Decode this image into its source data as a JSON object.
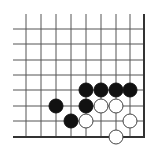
{
  "board": {
    "type": "go-diagram",
    "description": "Lower-right corner of a Go board",
    "colors": {
      "background": "#ffffff",
      "line": "#555555",
      "edge": "#333333",
      "black_stone": "#111111",
      "white_stone": "#ffffff",
      "white_outline": "#444444"
    },
    "grid": {
      "x_lines": [
        26,
        41,
        56,
        71,
        86,
        101,
        116,
        130
      ],
      "y_lines": [
        29,
        44,
        60,
        75,
        90,
        106,
        121
      ],
      "right_edge_x": 144,
      "bottom_edge_y": 137,
      "line_left_start": 13,
      "line_top_start": 14
    },
    "stone_radius": 7,
    "stones": [
      {
        "color": "black",
        "x": 86,
        "y": 90
      },
      {
        "color": "black",
        "x": 101,
        "y": 90
      },
      {
        "color": "black",
        "x": 116,
        "y": 90
      },
      {
        "color": "black",
        "x": 130,
        "y": 90
      },
      {
        "color": "black",
        "x": 56,
        "y": 106
      },
      {
        "color": "black",
        "x": 86,
        "y": 106
      },
      {
        "color": "black",
        "x": 71,
        "y": 121
      },
      {
        "color": "white",
        "x": 101,
        "y": 106
      },
      {
        "color": "white",
        "x": 116,
        "y": 106
      },
      {
        "color": "white",
        "x": 86,
        "y": 121
      },
      {
        "color": "white",
        "x": 130,
        "y": 121
      },
      {
        "color": "white",
        "x": 116,
        "y": 137
      }
    ]
  }
}
